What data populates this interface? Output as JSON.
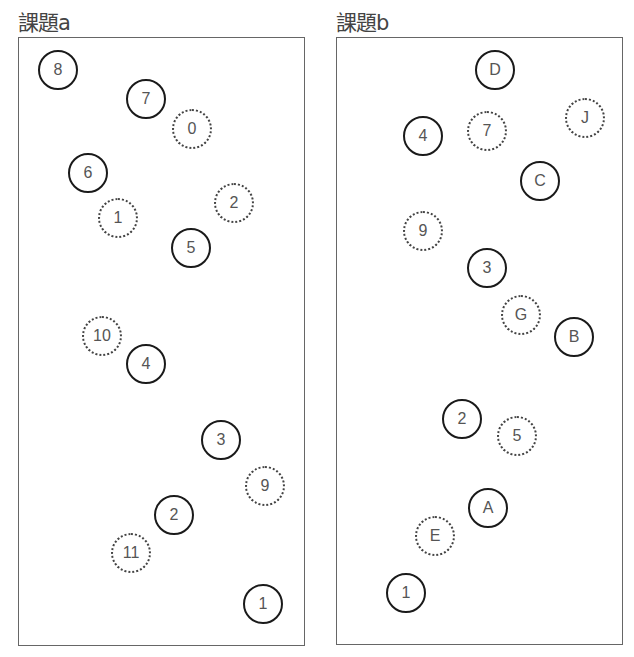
{
  "panels": [
    {
      "title": "課題a",
      "box": {
        "x": 18,
        "y": 37,
        "w": 287,
        "h": 609
      },
      "nodes": [
        {
          "label": "8",
          "style": "solid",
          "x": 58,
          "y": 70
        },
        {
          "label": "7",
          "style": "solid",
          "x": 146,
          "y": 99
        },
        {
          "label": "0",
          "style": "dotted",
          "x": 192,
          "y": 129
        },
        {
          "label": "6",
          "style": "solid",
          "x": 88,
          "y": 173
        },
        {
          "label": "2",
          "style": "dotted",
          "x": 234,
          "y": 203
        },
        {
          "label": "1",
          "style": "dotted",
          "x": 118,
          "y": 218
        },
        {
          "label": "5",
          "style": "solid",
          "x": 191,
          "y": 248
        },
        {
          "label": "10",
          "style": "dotted",
          "x": 102,
          "y": 336
        },
        {
          "label": "4",
          "style": "solid",
          "x": 146,
          "y": 364
        },
        {
          "label": "3",
          "style": "solid",
          "x": 221,
          "y": 440
        },
        {
          "label": "9",
          "style": "dotted",
          "x": 265,
          "y": 486
        },
        {
          "label": "2",
          "style": "solid",
          "x": 174,
          "y": 515
        },
        {
          "label": "11",
          "style": "dotted",
          "x": 131,
          "y": 553
        },
        {
          "label": "1",
          "style": "solid",
          "x": 263,
          "y": 604
        }
      ]
    },
    {
      "title": "課題b",
      "box": {
        "x": 336,
        "y": 37,
        "w": 287,
        "h": 608
      },
      "nodes": [
        {
          "label": "D",
          "style": "solid",
          "x": 495,
          "y": 70
        },
        {
          "label": "J",
          "style": "dotted",
          "x": 585,
          "y": 118
        },
        {
          "label": "7",
          "style": "dotted",
          "x": 487,
          "y": 131
        },
        {
          "label": "4",
          "style": "solid",
          "x": 423,
          "y": 136
        },
        {
          "label": "C",
          "style": "solid",
          "x": 540,
          "y": 181
        },
        {
          "label": "9",
          "style": "dotted",
          "x": 423,
          "y": 231
        },
        {
          "label": "3",
          "style": "solid",
          "x": 487,
          "y": 268
        },
        {
          "label": "G",
          "style": "dotted",
          "x": 521,
          "y": 315
        },
        {
          "label": "B",
          "style": "solid",
          "x": 574,
          "y": 337
        },
        {
          "label": "2",
          "style": "solid",
          "x": 462,
          "y": 419
        },
        {
          "label": "5",
          "style": "dotted",
          "x": 517,
          "y": 436
        },
        {
          "label": "A",
          "style": "solid",
          "x": 488,
          "y": 508
        },
        {
          "label": "E",
          "style": "dotted",
          "x": 435,
          "y": 536
        },
        {
          "label": "1",
          "style": "solid",
          "x": 406,
          "y": 593
        }
      ]
    }
  ]
}
